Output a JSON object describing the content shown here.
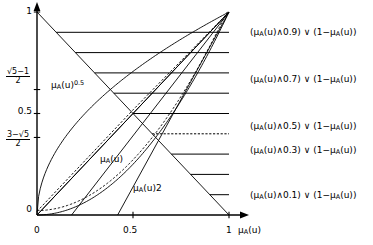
{
  "figure": {
    "kind": "fuzzy-membership-plot",
    "axes": {
      "x_axis_label": "μA(u)",
      "y_axis_label": "",
      "x_ticks": [
        "0",
        "0.5",
        "1"
      ],
      "x_tick_values": [
        0,
        0.5,
        1
      ],
      "y_ticks_text": [
        "1",
        "0.5",
        "0"
      ],
      "y_tick_values": [
        1,
        0.618033,
        0.5,
        0.381966,
        0
      ],
      "y_special_upper": {
        "numerator": "√5−1",
        "denominator": "2",
        "value": 0.618
      },
      "y_special_lower": {
        "numerator": "3−√5",
        "denominator": "2",
        "value": 0.382
      },
      "xlim": [
        0,
        1
      ],
      "ylim": [
        0,
        1
      ],
      "grid": false
    },
    "curve_labels": [
      {
        "id": "sqrt-curve",
        "text_main": "μA(u)",
        "text_sup": "0.5"
      },
      {
        "id": "identity-curve",
        "text_main": "μA(u)",
        "text_sup": ""
      },
      {
        "id": "square-curve",
        "text_main": "μA(u)2",
        "text_sup": ""
      }
    ],
    "right_labels": [
      {
        "id": "lvl-09",
        "value": 0.9,
        "text": "(μA(u)∧0.9) ∨ (1−μA(u))"
      },
      {
        "id": "lvl-07",
        "value": 0.7,
        "text": "(μA(u)∧0.7) ∨ (1−μA(u))"
      },
      {
        "id": "lvl-05",
        "value": 0.5,
        "text": "(μA(u)∧0.5) ∨ (1−μA(u))"
      },
      {
        "id": "lvl-03",
        "value": 0.3,
        "text": "(μA(u)∧0.3) ∨ (1−μA(u))"
      },
      {
        "id": "lvl-01",
        "value": 0.1,
        "text": "(μA(u)∧0.1) ∨ (1−μA(u))"
      }
    ],
    "level_lines": [
      {
        "value": 0.9,
        "dashed": false
      },
      {
        "value": 0.8,
        "dashed": false
      },
      {
        "value": 0.7,
        "dashed": false
      },
      {
        "value": 0.6,
        "dashed": false
      },
      {
        "value": 0.5,
        "dashed": false
      },
      {
        "value": 0.4,
        "dashed": true
      },
      {
        "value": 0.3,
        "dashed": false
      },
      {
        "value": 0.2,
        "dashed": false
      },
      {
        "value": 0.1,
        "dashed": false
      }
    ],
    "colors": {
      "ink": "#000000",
      "paper": "#ffffff"
    }
  },
  "chart_data": {
    "type": "line",
    "title": "",
    "xlabel": "μA(u)",
    "ylabel": "",
    "xlim": [
      0,
      1
    ],
    "ylim": [
      0,
      1
    ],
    "grid": false,
    "legend": "none",
    "x": [
      0,
      0.1,
      0.2,
      0.3,
      0.4,
      0.5,
      0.6,
      0.7,
      0.8,
      0.9,
      1
    ],
    "series": [
      {
        "name": "μA(u)^0.5",
        "style": "solid",
        "values": [
          0,
          0.316,
          0.447,
          0.548,
          0.632,
          0.707,
          0.775,
          0.837,
          0.894,
          0.949,
          1
        ]
      },
      {
        "name": "μA(u)",
        "style": "solid",
        "values": [
          0,
          0.1,
          0.2,
          0.3,
          0.4,
          0.5,
          0.6,
          0.7,
          0.8,
          0.9,
          1
        ]
      },
      {
        "name": "μA(u)^2",
        "style": "solid",
        "values": [
          0,
          0.01,
          0.04,
          0.09,
          0.16,
          0.25,
          0.36,
          0.49,
          0.64,
          0.81,
          1
        ]
      },
      {
        "name": "1−μA(u)",
        "style": "solid",
        "values": [
          1,
          0.9,
          0.8,
          0.7,
          0.6,
          0.5,
          0.4,
          0.3,
          0.2,
          0.1,
          0
        ]
      },
      {
        "name": "μA(u)^0.5 dashed approx",
        "style": "dashed",
        "values": [
          0,
          0.316,
          0.447,
          0.548,
          0.632,
          0.707,
          0.775,
          0.837,
          0.894,
          0.949,
          1
        ]
      }
    ],
    "annotations": [
      "(μA(u)∧0.9) ∨ (1−μA(u))",
      "(μA(u)∧0.7) ∨ (1−μA(u))",
      "(μA(u)∧0.5) ∨ (1−μA(u))",
      "(μA(u)∧0.3) ∨ (1−μA(u))",
      "(μA(u)∧0.1) ∨ (1−μA(u))"
    ]
  }
}
